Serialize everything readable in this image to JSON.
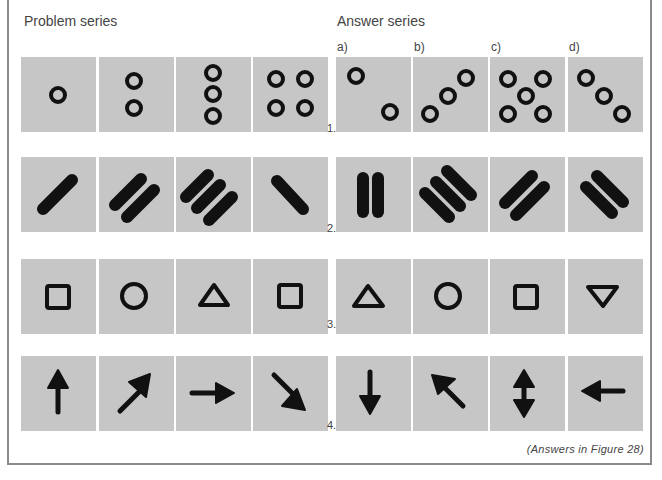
{
  "headers": {
    "problem": "Problem series",
    "answer": "Answer series"
  },
  "answer_labels": [
    "a)",
    "b)",
    "c)",
    "d)"
  ],
  "rows": [
    {
      "number": "1.",
      "problem": [
        "one-circle",
        "two-circles-vertical",
        "three-circles-vertical",
        "four-circles-square"
      ],
      "answers": [
        "two-circles-diagonal-down",
        "three-circles-diagonal-up",
        "five-circles-x",
        "three-circles-diagonal-down"
      ]
    },
    {
      "number": "2.",
      "problem": [
        "one-bar-rising",
        "two-bars-rising",
        "three-bars-rising",
        "one-bar-falling"
      ],
      "answers": [
        "two-bars-vertical",
        "three-bars-falling",
        "two-bars-rising",
        "two-bars-falling"
      ]
    },
    {
      "number": "3.",
      "problem": [
        "square",
        "circle",
        "triangle-up",
        "square"
      ],
      "answers": [
        "triangle-up",
        "circle",
        "square",
        "triangle-down"
      ]
    },
    {
      "number": "4.",
      "problem": [
        "arrow-up",
        "arrow-up-right",
        "arrow-right",
        "arrow-down-right"
      ],
      "answers": [
        "arrow-down",
        "arrow-up-left",
        "arrow-up-down",
        "arrow-left"
      ]
    }
  ],
  "footer_note": "(Answers in Figure 28)",
  "colors": {
    "tile": "#c6c6c6",
    "ink": "#111111",
    "border": "#8a8a8a"
  }
}
